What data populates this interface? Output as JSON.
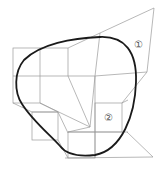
{
  "figure": {
    "type": "geometric-diagram",
    "colors": {
      "line": "#9a9a9a",
      "curve": "#1a1a1a",
      "label": "#555555",
      "background": "#ffffff"
    },
    "labels": [
      {
        "text": "①",
        "x": 138,
        "y": 45
      },
      {
        "text": "②",
        "x": 108,
        "y": 118
      }
    ]
  }
}
